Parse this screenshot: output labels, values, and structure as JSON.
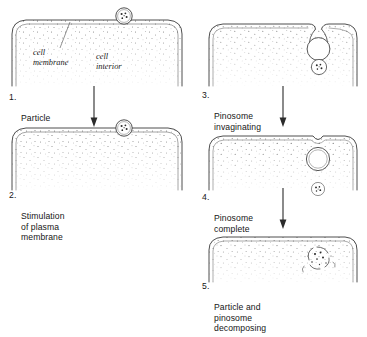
{
  "figure": {
    "columns": 2
  },
  "annotations": {
    "cell_membrane": "cell\nmembrane",
    "cell_interior": "cell\ninterior"
  },
  "stages": [
    {
      "number": "1.",
      "label": "Particle",
      "column": "left",
      "particle": "outside-above-membrane"
    },
    {
      "number": "2.",
      "label": "Stimulation\nof plasma\nmembrane",
      "column": "left",
      "particle": "contacting-membrane"
    },
    {
      "number": "3.",
      "label": "Pinosome\ninvaginating",
      "column": "right",
      "particle": "enclosed-in-open-invagination"
    },
    {
      "number": "4.",
      "label": "Pinosome\ncomplete",
      "column": "right",
      "particle": "enclosed-in-sealed-vesicle"
    },
    {
      "number": "5.",
      "label": "Particle and\npinosome\ndecomposing",
      "column": "right",
      "particle": "vesicle-breaking-down"
    }
  ],
  "arrows": [
    {
      "name": "arrow-stage-1-to-2"
    },
    {
      "name": "arrow-stage-3-to-4"
    },
    {
      "name": "arrow-stage-4-to-5"
    }
  ],
  "colors": {
    "ink": "#1a1a1a",
    "membrane_line": "#3a3a3a",
    "stipple": "#555555",
    "background": "#ffffff"
  }
}
